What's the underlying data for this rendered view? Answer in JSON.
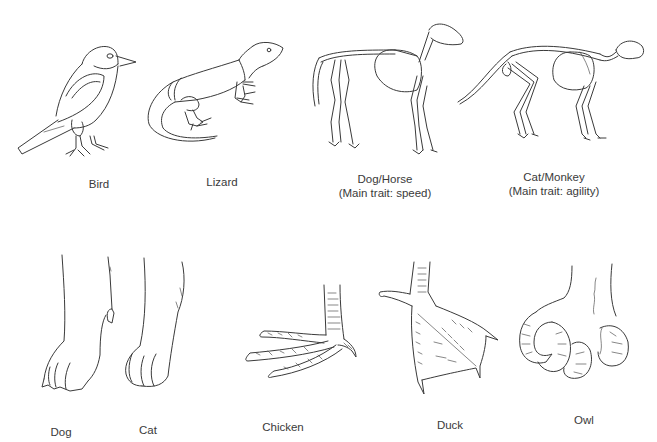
{
  "top_row": [
    {
      "id": "bird",
      "label": "Bird",
      "subtitle": null
    },
    {
      "id": "lizard",
      "label": "Lizard",
      "subtitle": null
    },
    {
      "id": "dog-horse",
      "label": "Dog/Horse",
      "subtitle": "(Main trait: speed)"
    },
    {
      "id": "cat-monkey",
      "label": "Cat/Monkey",
      "subtitle": "(Main trait: agility)"
    }
  ],
  "bottom_row": [
    {
      "id": "dog-paw",
      "label": "Dog"
    },
    {
      "id": "cat-paw",
      "label": "Cat"
    },
    {
      "id": "chicken-foot",
      "label": "Chicken"
    },
    {
      "id": "duck-foot",
      "label": "Duck"
    },
    {
      "id": "owl-foot",
      "label": "Owl"
    }
  ],
  "colors": {
    "background": "#ffffff",
    "line": "#3a3a3a",
    "text": "#3a3a3a"
  }
}
